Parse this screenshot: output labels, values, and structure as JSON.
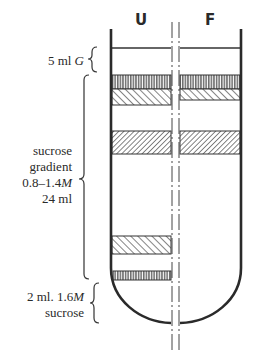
{
  "diagram": {
    "columns": [
      {
        "id": "U",
        "label": "U"
      },
      {
        "id": "F",
        "label": "F"
      }
    ],
    "labels": {
      "top_layer": {
        "prefix": "5 ml ",
        "italic": "G"
      },
      "gradient": {
        "line1": "sucrose",
        "line2": "gradient",
        "line3_prefix": "0.8–1.4",
        "line3_italic": "M",
        "line4": "24 ml"
      },
      "cushion": {
        "line1_prefix": "2 ml. 1.6",
        "line1_italic": "M",
        "line2": "sucrose"
      }
    },
    "bands": {
      "U": [
        {
          "name": "band-1",
          "pattern": "vertical",
          "top": 75,
          "bottom": 89
        },
        {
          "name": "band-2",
          "pattern": "diagonal-back",
          "top": 89,
          "bottom": 105
        },
        {
          "name": "band-3",
          "pattern": "diagonal-forward",
          "top": 131,
          "bottom": 154
        },
        {
          "name": "band-4",
          "pattern": "diagonal-back",
          "top": 236,
          "bottom": 254
        },
        {
          "name": "band-5",
          "pattern": "vertical",
          "top": 271,
          "bottom": 280
        }
      ],
      "F": [
        {
          "name": "band-1",
          "pattern": "vertical",
          "top": 75,
          "bottom": 89
        },
        {
          "name": "band-2",
          "pattern": "diagonal-back",
          "top": 89,
          "bottom": 100
        },
        {
          "name": "band-3",
          "pattern": "diagonal-forward",
          "top": 131,
          "bottom": 154
        }
      ]
    },
    "colors": {
      "ink": "#2a2a2a",
      "background": "#ffffff"
    }
  }
}
